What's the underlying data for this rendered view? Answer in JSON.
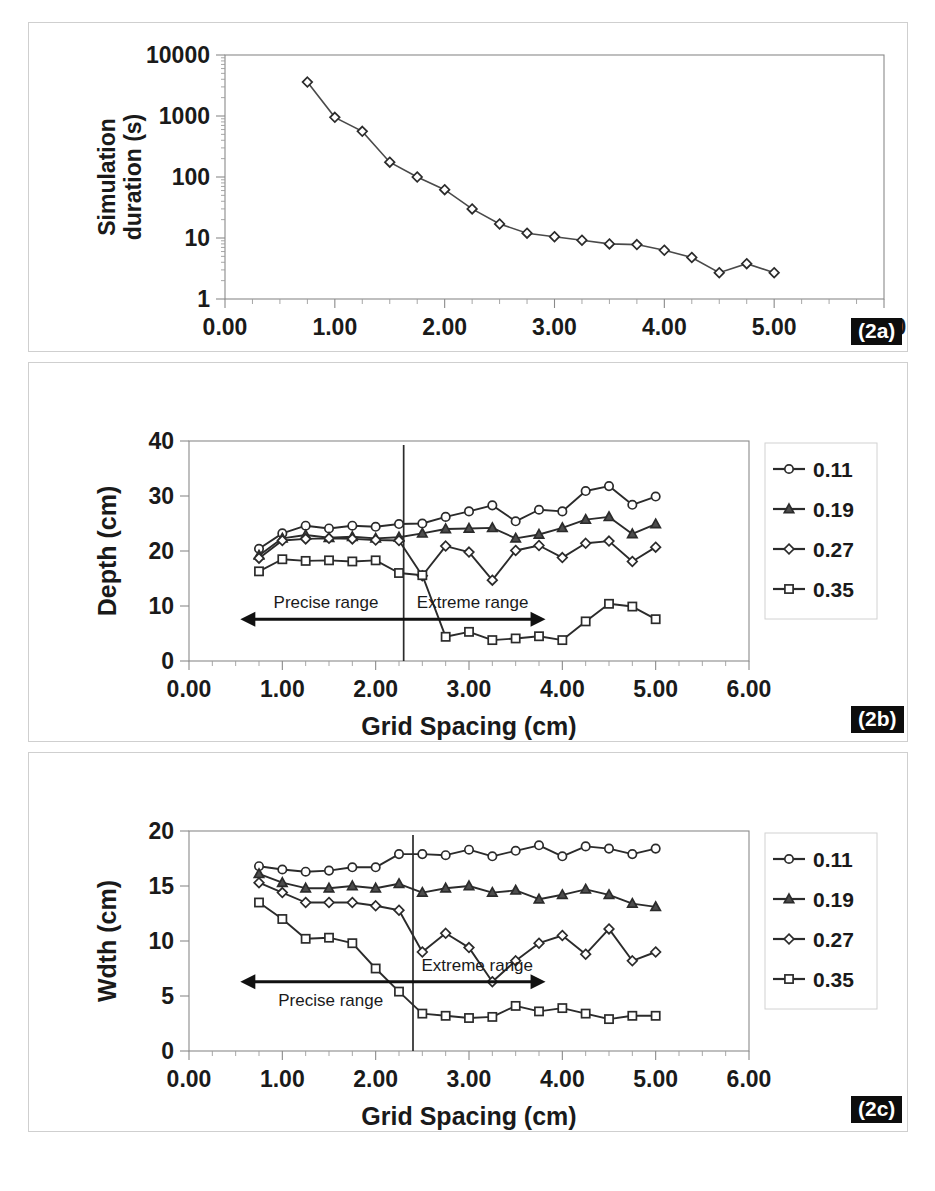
{
  "figure": {
    "panel_labels": {
      "a": "(2a)",
      "b": "(2b)",
      "c": "(2c)"
    },
    "shared_xlabel": "Grid Spacing (cm)",
    "x_tick_labels": [
      "0.00",
      "1.00",
      "2.00",
      "3.00",
      "4.00",
      "5.00",
      "6.00"
    ],
    "annotations": {
      "precise": "Precise range",
      "extreme": "Extreme range"
    },
    "colors": {
      "line": "#2b2b2b",
      "frame": "#8a8a8a",
      "badge_bg": "#0d0d0d",
      "badge_text": "#ffffff"
    }
  },
  "chart_data": [
    {
      "id": "2a",
      "type": "line",
      "title": "",
      "xlabel": "Grid Spacing (cm)",
      "ylabel": "Simulation duration (s)",
      "yscale": "log",
      "xlim": [
        0,
        6
      ],
      "ylim": [
        1,
        10000
      ],
      "y_tick_labels": [
        "1",
        "10",
        "100",
        "1000",
        "10000"
      ],
      "y_ticks": [
        1,
        10,
        100,
        1000,
        10000
      ],
      "x_ticks": [
        0,
        1,
        2,
        3,
        4,
        5,
        6
      ],
      "grid": false,
      "legend": "none",
      "series": [
        {
          "name": "Simulation duration",
          "marker": "diamond-open",
          "x": [
            0.75,
            1.0,
            1.25,
            1.5,
            1.75,
            2.0,
            2.25,
            2.5,
            2.75,
            3.0,
            3.25,
            3.5,
            3.75,
            4.0,
            4.25,
            4.5,
            4.75,
            5.0
          ],
          "values": [
            3600,
            950,
            560,
            175,
            100,
            62,
            30,
            17,
            12,
            10.5,
            9.2,
            8.0,
            7.8,
            6.3,
            4.8,
            2.7,
            3.8,
            2.7,
            4.6
          ]
        }
      ]
    },
    {
      "id": "2b",
      "type": "line",
      "title": "",
      "xlabel": "Grid Spacing (cm)",
      "ylabel": "Depth (cm)",
      "yscale": "linear",
      "xlim": [
        0,
        6
      ],
      "ylim": [
        0,
        40
      ],
      "y_tick_labels": [
        "0",
        "10",
        "20",
        "30",
        "40"
      ],
      "y_ticks": [
        0,
        10,
        20,
        30,
        40
      ],
      "x_ticks": [
        0,
        1,
        2,
        3,
        4,
        5,
        6
      ],
      "grid": false,
      "legend": "right",
      "divider_x": 2.3,
      "arrow_y": 7.6,
      "annotation_labels": {
        "left": "Precise range",
        "right": "Extreme range"
      },
      "x": [
        0.75,
        1.0,
        1.25,
        1.5,
        1.75,
        2.0,
        2.25,
        2.5,
        2.75,
        3.0,
        3.25,
        3.5,
        3.75,
        4.0,
        4.25,
        4.5,
        4.75,
        5.0
      ],
      "series": [
        {
          "name": "0.11",
          "marker": "circle-open",
          "values": [
            20.4,
            23.2,
            24.6,
            24.1,
            24.6,
            24.4,
            24.9,
            25.0,
            26.2,
            27.2,
            28.3,
            25.4,
            27.5,
            27.2,
            30.9,
            31.8,
            28.4,
            29.9
          ]
        },
        {
          "name": "0.19",
          "marker": "triangle-solid",
          "values": [
            19.2,
            22.3,
            22.9,
            22.4,
            22.6,
            22.3,
            22.5,
            23.2,
            24.0,
            24.1,
            24.2,
            22.3,
            23.0,
            24.2,
            25.7,
            26.2,
            23.1,
            24.9
          ]
        },
        {
          "name": "0.27",
          "marker": "diamond-open",
          "values": [
            18.7,
            21.9,
            22.2,
            22.3,
            22.2,
            22.0,
            21.9,
            15.5,
            20.9,
            19.8,
            14.7,
            20.1,
            21.0,
            18.8,
            21.4,
            21.8,
            18.1,
            20.7
          ]
        },
        {
          "name": "0.35",
          "marker": "square-open",
          "values": [
            16.3,
            18.5,
            18.2,
            18.3,
            18.1,
            18.3,
            16.0,
            15.6,
            4.4,
            5.3,
            3.8,
            4.1,
            4.5,
            3.8,
            7.2,
            10.4,
            9.9,
            7.6,
            5.0
          ]
        }
      ]
    },
    {
      "id": "2c",
      "type": "line",
      "title": "",
      "xlabel": "Grid Spacing (cm)",
      "ylabel": "Wdth (cm)",
      "yscale": "linear",
      "xlim": [
        0,
        6
      ],
      "ylim": [
        0,
        20
      ],
      "y_tick_labels": [
        "0",
        "5",
        "10",
        "15",
        "20"
      ],
      "y_ticks": [
        0,
        5,
        10,
        15,
        20
      ],
      "x_ticks": [
        0,
        1,
        2,
        3,
        4,
        5,
        6
      ],
      "grid": false,
      "legend": "right",
      "divider_x": 2.4,
      "arrow_y": 6.3,
      "annotation_labels": {
        "left": "Precise range",
        "right": "Extreme range"
      },
      "x": [
        0.75,
        1.0,
        1.25,
        1.5,
        1.75,
        2.0,
        2.25,
        2.5,
        2.75,
        3.0,
        3.25,
        3.5,
        3.75,
        4.0,
        4.25,
        4.5,
        4.75,
        5.0
      ],
      "series": [
        {
          "name": "0.11",
          "marker": "circle-open",
          "values": [
            16.8,
            16.5,
            16.3,
            16.4,
            16.7,
            16.7,
            17.9,
            17.9,
            17.8,
            18.3,
            17.7,
            18.2,
            18.7,
            17.7,
            18.6,
            18.4,
            17.9,
            18.4
          ]
        },
        {
          "name": "0.19",
          "marker": "triangle-solid",
          "values": [
            16.1,
            15.3,
            14.8,
            14.8,
            15.0,
            14.8,
            15.2,
            14.4,
            14.8,
            15.0,
            14.4,
            14.6,
            13.8,
            14.2,
            14.7,
            14.2,
            13.4,
            13.1,
            14.3
          ]
        },
        {
          "name": "0.27",
          "marker": "diamond-open",
          "values": [
            15.3,
            14.4,
            13.5,
            13.5,
            13.5,
            13.2,
            12.8,
            9.0,
            10.7,
            9.4,
            6.3,
            8.2,
            9.8,
            10.5,
            8.8,
            11.1,
            8.2,
            9.0,
            10.2
          ]
        },
        {
          "name": "0.35",
          "marker": "square-open",
          "values": [
            13.5,
            12.0,
            10.2,
            10.3,
            9.8,
            7.5,
            5.4,
            3.4,
            3.2,
            3.0,
            3.1,
            4.1,
            3.6,
            3.9,
            3.4,
            2.9,
            3.2,
            3.2
          ]
        }
      ]
    }
  ]
}
